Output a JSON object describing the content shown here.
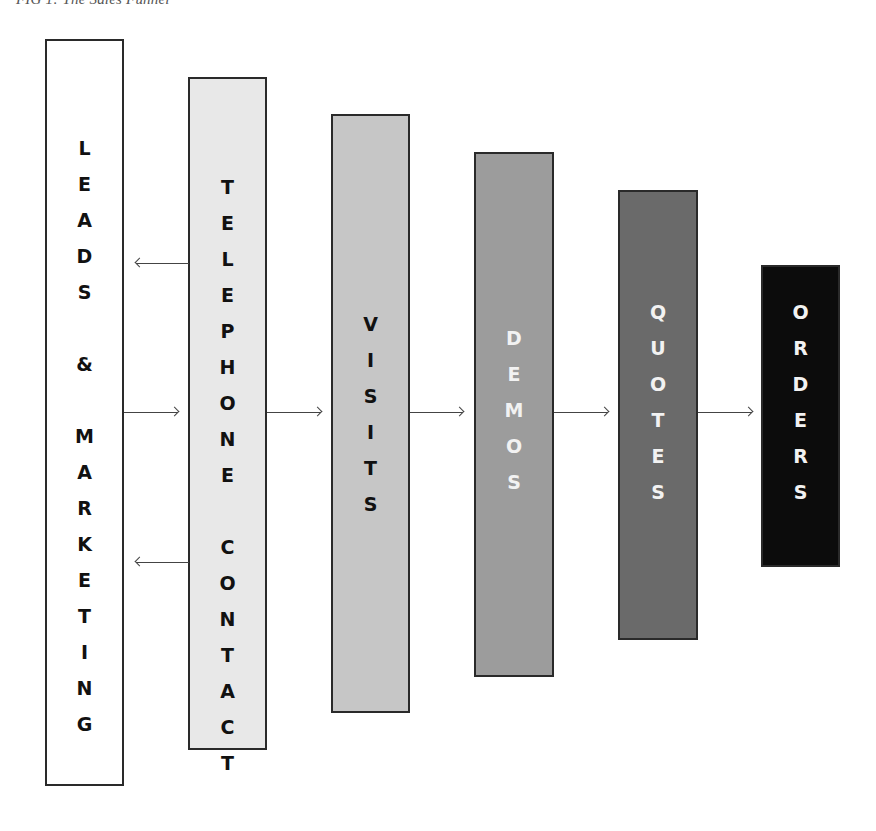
{
  "caption": "FIG 1: The Sales Funnel",
  "stages": [
    {
      "id": "leads-marketing",
      "label": "LEADS & MARKETING",
      "letters": [
        "L",
        "E",
        "A",
        "D",
        "S",
        "",
        "&",
        "",
        "M",
        "A",
        "R",
        "K",
        "E",
        "T",
        "I",
        "N",
        "G"
      ],
      "fill": "#ffffff",
      "text_color": "#111111",
      "box": {
        "left": 45,
        "top": 39,
        "width": 79,
        "height": 747
      },
      "letters_top": 91
    },
    {
      "id": "telephone-contact",
      "label": "TELEPHONE CONTACT",
      "letters": [
        "T",
        "E",
        "L",
        "E",
        "P",
        "H",
        "O",
        "N",
        "E",
        "",
        "C",
        "O",
        "N",
        "T",
        "A",
        "C",
        "T"
      ],
      "fill": "#e8e8e8",
      "text_color": "#111111",
      "box": {
        "left": 188,
        "top": 77,
        "width": 79,
        "height": 673
      },
      "letters_top": 92
    },
    {
      "id": "visits",
      "label": "VISITS",
      "letters": [
        "V",
        "I",
        "S",
        "I",
        "T",
        "S"
      ],
      "fill": "#c6c6c6",
      "text_color": "#111111",
      "box": {
        "left": 331,
        "top": 114,
        "width": 79,
        "height": 599
      },
      "letters_top": 192
    },
    {
      "id": "demos",
      "label": "DEMOS",
      "letters": [
        "D",
        "E",
        "M",
        "O",
        "S"
      ],
      "fill": "#9c9c9c",
      "text_color": "#f2f2f2",
      "box": {
        "left": 474,
        "top": 152,
        "width": 80,
        "height": 525
      },
      "letters_top": 168
    },
    {
      "id": "quotes",
      "label": "QUOTES",
      "letters": [
        "Q",
        "U",
        "O",
        "T",
        "E",
        "S"
      ],
      "fill": "#6a6a6a",
      "text_color": "#f2f2f2",
      "box": {
        "left": 618,
        "top": 190,
        "width": 80,
        "height": 450
      },
      "letters_top": 104
    },
    {
      "id": "orders",
      "label": "ORDERS",
      "letters": [
        "O",
        "R",
        "D",
        "E",
        "R",
        "S"
      ],
      "fill": "#0c0c0c",
      "text_color": "#f2f2f2",
      "box": {
        "left": 761,
        "top": 265,
        "width": 79,
        "height": 302
      },
      "letters_top": 29
    }
  ],
  "arrows": [
    {
      "id": "telephone-to-leads-upper",
      "direction": "left",
      "x1": 136,
      "x2": 189,
      "y": 263
    },
    {
      "id": "leads-to-telephone",
      "direction": "right",
      "x1": 124,
      "x2": 178,
      "y": 412
    },
    {
      "id": "telephone-to-leads-lower",
      "direction": "left",
      "x1": 136,
      "x2": 189,
      "y": 562
    },
    {
      "id": "telephone-to-visits",
      "direction": "right",
      "x1": 267,
      "x2": 321,
      "y": 412
    },
    {
      "id": "visits-to-demos",
      "direction": "right",
      "x1": 410,
      "x2": 463,
      "y": 412
    },
    {
      "id": "demos-to-quotes",
      "direction": "right",
      "x1": 554,
      "x2": 608,
      "y": 412
    },
    {
      "id": "quotes-to-orders",
      "direction": "right",
      "x1": 698,
      "x2": 752,
      "y": 412
    }
  ]
}
